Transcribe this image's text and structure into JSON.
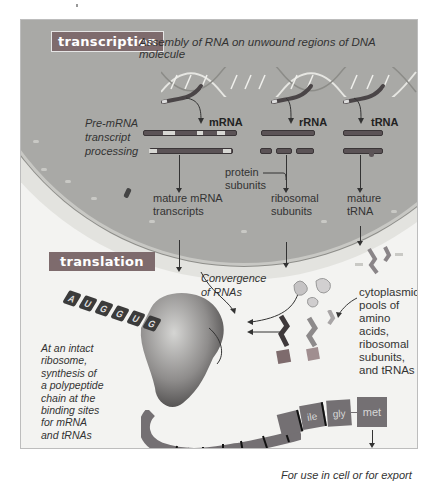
{
  "figure": {
    "colors": {
      "badge": "#7e6b6d",
      "nucleus": "#a9a9a6",
      "cytoplasm": "#f3f3f1",
      "rna_strand": "#5b5356",
      "polypeptide": "#747073"
    },
    "transcription": {
      "badge_label": "transcription",
      "caption": "Assembly of RNA on unwound regions of DNA molecule",
      "processing_label_lines": [
        "Pre-mRNA",
        "transcript",
        "processing"
      ],
      "rna_types": [
        {
          "label": "mRNA",
          "product_lines": [
            "mature mRNA",
            "transcripts"
          ]
        },
        {
          "label": "rRNA",
          "product_lines": [
            "ribosomal",
            "subunits"
          ]
        },
        {
          "label": "tRNA",
          "product_lines": [
            "mature",
            "tRNA"
          ]
        }
      ],
      "protein_subunits_lines": [
        "protein",
        "subunits"
      ]
    },
    "translation": {
      "badge_label": "translation",
      "convergence_lines": [
        "Convergence",
        "of RNAs"
      ],
      "cytoplasmic_pools_lines": [
        "cytoplasmic",
        "pools of",
        "amino acids,",
        "ribosomal",
        "subunits,",
        "and tRNAs"
      ],
      "ribosome_caption_lines": [
        "At an intact",
        "ribosome,",
        "synthesis of",
        "a polypeptide",
        "chain at the",
        "binding sites",
        "for mRNA",
        "and tRNAs"
      ],
      "mrna_codons": [
        "A",
        "U",
        "G",
        "G",
        "U",
        "G"
      ],
      "amino_acids": [
        "met",
        "gly",
        "ile"
      ]
    },
    "final": {
      "badge_label": "final protein",
      "caption": "For use in cell or for export"
    }
  }
}
